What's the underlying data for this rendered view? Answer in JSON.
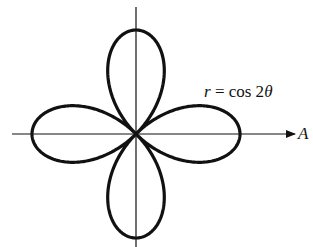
{
  "diagram": {
    "equation": {
      "r": "r",
      "eq": " = cos 2",
      "theta": "θ"
    },
    "axis_label": "A",
    "curve": {
      "type": "polar",
      "function": "r = cos 2θ",
      "petals": 4,
      "max_r": 1
    },
    "colors": {
      "stroke": "#111111",
      "background": "#ffffff"
    }
  }
}
